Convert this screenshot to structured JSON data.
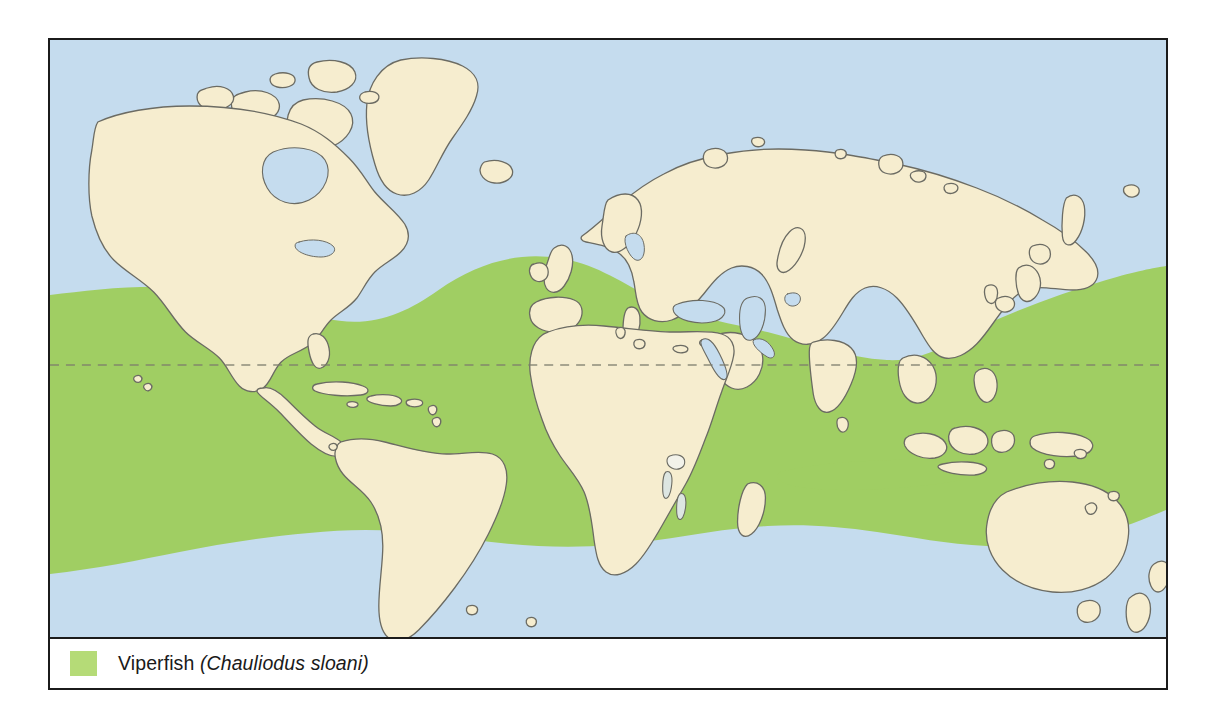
{
  "figure": {
    "type": "species-distribution-map",
    "projection": "world-equirectangular"
  },
  "map": {
    "ocean_color": "#c5dcee",
    "land_color": "#f6edcf",
    "range_color": "#a0ce63",
    "coastline_color": "#6b6b63",
    "frame_color": "#1b1b1b",
    "equator_label": "equator",
    "equator_style": "dashed"
  },
  "legend": {
    "swatch_color": "#b5db77",
    "common_name": "Viperfish",
    "scientific_name": "(Chauliodus sloani)"
  }
}
